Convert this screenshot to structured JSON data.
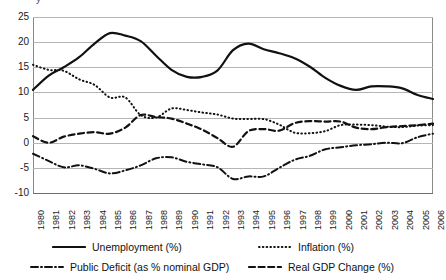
{
  "chart_title_clipped": "y",
  "legend": {
    "position": "bottom",
    "items": [
      {
        "label": "Unemployment (%)",
        "style": "solid",
        "key": "unemployment"
      },
      {
        "label": "Inflation (%)",
        "style": "dotted",
        "key": "inflation"
      },
      {
        "label": "Public Deficit (as % nominal GDP)",
        "style": "dash-dot",
        "key": "public_deficit"
      },
      {
        "label": "Real GDP Change (%)",
        "style": "dashed",
        "key": "real_gdp_change"
      }
    ]
  },
  "axes": {
    "y_ticks": [
      "25",
      "20",
      "15",
      "10",
      "5",
      "0",
      "-5",
      "-10"
    ],
    "y_tick_values": [
      25,
      20,
      15,
      10,
      5,
      0,
      -5,
      -10
    ],
    "x_ticks": [
      "1980",
      "1981",
      "1982",
      "1983",
      "1984",
      "1985",
      "1986",
      "1987",
      "1988",
      "1989",
      "1990",
      "1991",
      "1992",
      "1993",
      "1994",
      "1995",
      "1996",
      "1997",
      "1998",
      "1999",
      "2000",
      "2001",
      "2002",
      "2003",
      "2004",
      "2005",
      "2006"
    ]
  },
  "chart_data": {
    "type": "line",
    "title": "",
    "xlabel": "",
    "ylabel": "",
    "ylim": [
      -10,
      25
    ],
    "grid": true,
    "legend_position": "bottom",
    "x": [
      1980,
      1981,
      1982,
      1983,
      1984,
      1985,
      1986,
      1987,
      1988,
      1989,
      1990,
      1991,
      1992,
      1993,
      1994,
      1995,
      1996,
      1997,
      1998,
      1999,
      2000,
      2001,
      2002,
      2003,
      2004,
      2005,
      2006
    ],
    "categories": [
      "1980",
      "1981",
      "1982",
      "1983",
      "1984",
      "1985",
      "1986",
      "1987",
      "1988",
      "1989",
      "1990",
      "1991",
      "1992",
      "1993",
      "1994",
      "1995",
      "1996",
      "1997",
      "1998",
      "1999",
      "2000",
      "2001",
      "2002",
      "2003",
      "2004",
      "2005",
      "2006"
    ],
    "series": [
      {
        "name": "Unemployment (%)",
        "style": "solid",
        "values": [
          10.5,
          13.3,
          15.0,
          17.0,
          19.7,
          21.8,
          21.3,
          20.2,
          17.3,
          14.5,
          13.1,
          13.1,
          14.4,
          18.4,
          19.7,
          18.6,
          17.8,
          16.8,
          15.1,
          12.9,
          11.3,
          10.5,
          11.2,
          11.2,
          10.8,
          9.5,
          8.7
        ]
      },
      {
        "name": "Inflation (%)",
        "style": "dotted",
        "values": [
          15.5,
          14.5,
          14.3,
          12.6,
          11.5,
          9.0,
          9.0,
          5.5,
          5.0,
          6.8,
          6.5,
          6.0,
          5.6,
          4.8,
          4.7,
          4.7,
          3.6,
          2.0,
          1.9,
          2.3,
          3.5,
          3.6,
          3.5,
          3.2,
          3.1,
          3.4,
          3.5
        ]
      },
      {
        "name": "Public Deficit (as % nominal GDP)",
        "style": "dash-dot",
        "values": [
          -2.2,
          -3.6,
          -4.9,
          -4.5,
          -5.2,
          -6.1,
          -5.5,
          -4.5,
          -3.1,
          -2.9,
          -3.8,
          -4.3,
          -4.9,
          -7.2,
          -6.7,
          -6.7,
          -5.0,
          -3.4,
          -2.6,
          -1.3,
          -0.9,
          -0.5,
          -0.3,
          0.0,
          -0.1,
          1.1,
          1.8
        ]
      },
      {
        "name": "Real GDP Change (%)",
        "style": "dashed",
        "values": [
          1.3,
          0.0,
          1.2,
          1.8,
          2.1,
          1.8,
          3.0,
          5.5,
          5.1,
          4.8,
          3.8,
          2.6,
          0.9,
          -0.8,
          2.3,
          2.7,
          2.4,
          3.9,
          4.3,
          4.2,
          4.2,
          3.0,
          2.7,
          3.1,
          3.3,
          3.5,
          3.8
        ]
      }
    ]
  }
}
